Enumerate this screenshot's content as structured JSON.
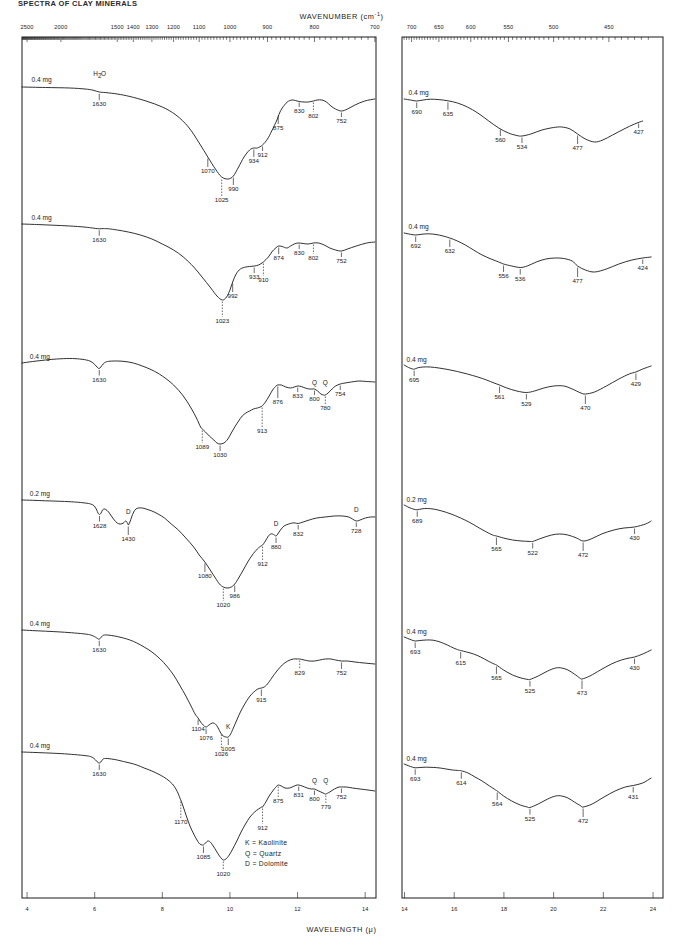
{
  "page": {
    "header": "SPECTRA OF CLAY MINERALS",
    "axis_top_title": "WAVENUMBER (cm",
    "axis_top_title_sup": "-1",
    "axis_top_title_end": ")",
    "axis_bottom_title": "WAVELENGTH (μ)"
  },
  "axes": {
    "left_panel": {
      "wavenumber_ticks": [
        2500,
        2000,
        1500,
        1400,
        1300,
        1200,
        1100,
        1000,
        900,
        800,
        700
      ],
      "wavelength_ticks": [
        4,
        6,
        8,
        10,
        12,
        14
      ]
    },
    "right_panel": {
      "wavenumber_ticks": [
        700,
        650,
        600,
        550,
        500,
        450
      ],
      "wavelength_ticks": [
        14,
        16,
        18,
        20,
        22,
        24
      ]
    }
  },
  "legend": {
    "items": [
      "K = Kaolinite",
      "Q = Quartz",
      "D = Dolomite"
    ]
  },
  "chart_data": {
    "type": "line",
    "title": "SPECTRA OF CLAY MINERALS",
    "xlabel_top": "WAVENUMBER (cm-1)",
    "xlabel_bottom": "WAVELENGTH (μ)",
    "ylabel": "Transmittance",
    "grid": false,
    "legend_position": "inside-bottom-right",
    "panels": [
      {
        "name": "left",
        "xlim_wavenumber": [
          2600,
          700
        ],
        "xlim_wavelength": [
          3.85,
          14.3
        ],
        "ticks_wavenumber": [
          2500,
          2000,
          1500,
          1400,
          1300,
          1200,
          1100,
          1000,
          900,
          800,
          700
        ],
        "ticks_wavelength": [
          4,
          6,
          8,
          10,
          12,
          14
        ]
      },
      {
        "name": "right",
        "xlim_wavenumber": [
          715,
          420
        ],
        "xlim_wavelength": [
          13.9,
          24.4
        ],
        "ticks_wavenumber": [
          700,
          650,
          600,
          550,
          500,
          450
        ],
        "ticks_wavelength": [
          14,
          16,
          18,
          20,
          22,
          24
        ]
      }
    ],
    "spectra": [
      {
        "index": 1,
        "sample_amount_left": "0.4 mg",
        "sample_amount_right": "0.4 mg",
        "annotations": [
          "H2O"
        ],
        "left_bands": [
          1630,
          1070,
          1025,
          990,
          934,
          912,
          875,
          830,
          802,
          752
        ],
        "right_bands": [
          690,
          635,
          560,
          534,
          477,
          427
        ],
        "band_markers": {
          "1025": "dashed",
          "802": "dashed"
        }
      },
      {
        "index": 2,
        "sample_amount_left": "0.4 mg",
        "sample_amount_right": "0.4 mg",
        "annotations": [],
        "left_bands": [
          1630,
          1023,
          992,
          933,
          910,
          874,
          830,
          802,
          752
        ],
        "right_bands": [
          692,
          632,
          556,
          536,
          477,
          424
        ],
        "band_markers": {
          "1023": "dashed",
          "910": "dashed",
          "802": "dashed"
        }
      },
      {
        "index": 3,
        "sample_amount_left": "0.4 mg",
        "sample_amount_right": "0.4 mg",
        "annotations": [
          "Q",
          "Q"
        ],
        "left_bands": [
          1630,
          1089,
          1030,
          913,
          876,
          833,
          800,
          780,
          754
        ],
        "right_bands": [
          695,
          561,
          529,
          470,
          429
        ],
        "band_markers": {
          "1089": "dashed",
          "913": "dashed",
          "780": "dashed"
        },
        "mineral_marks": [
          {
            "label": "Q",
            "wavenumber": 800
          },
          {
            "label": "Q",
            "wavenumber": 780
          }
        ]
      },
      {
        "index": 4,
        "sample_amount_left": "0.2 mg",
        "sample_amount_right": "0.2 mg",
        "annotations": [
          "D",
          "D",
          "D"
        ],
        "left_bands": [
          1628,
          1430,
          1080,
          1020,
          986,
          912,
          880,
          832,
          728
        ],
        "right_bands": [
          689,
          565,
          522,
          472,
          430
        ],
        "band_markers": {
          "1020": "dashed",
          "912": "dashed"
        },
        "mineral_marks": [
          {
            "label": "D",
            "wavenumber": 1430
          },
          {
            "label": "D",
            "wavenumber": 880
          },
          {
            "label": "D",
            "wavenumber": 728
          }
        ]
      },
      {
        "index": 5,
        "sample_amount_left": "0.4 mg",
        "sample_amount_right": "0.4 mg",
        "annotations": [
          "K"
        ],
        "left_bands": [
          1630,
          1104,
          1076,
          1026,
          1005,
          915,
          829,
          752
        ],
        "right_bands": [
          693,
          615,
          565,
          525,
          473,
          430
        ],
        "band_markers": {
          "1026": "dashed",
          "915": "dashed",
          "829": "dashed"
        },
        "mineral_marks": [
          {
            "label": "K",
            "wavenumber": 1005
          }
        ]
      },
      {
        "index": 6,
        "sample_amount_left": "0.4 mg",
        "sample_amount_right": "0.4 mg",
        "annotations": [
          "Q",
          "Q"
        ],
        "left_bands": [
          1630,
          1170,
          1085,
          1020,
          912,
          875,
          831,
          800,
          779,
          752
        ],
        "right_bands": [
          693,
          614,
          564,
          525,
          472,
          431
        ],
        "band_markers": {
          "1170": "dashed",
          "1020": "dashed",
          "912": "dashed",
          "875": "dashed",
          "779": "dashed"
        },
        "mineral_marks": [
          {
            "label": "Q",
            "wavenumber": 800
          },
          {
            "label": "Q",
            "wavenumber": 779
          }
        ]
      }
    ]
  }
}
